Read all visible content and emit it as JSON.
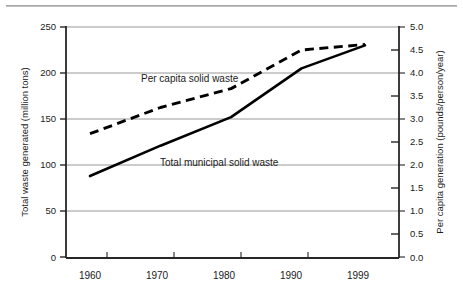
{
  "chart_data": {
    "type": "line",
    "title": "",
    "xlabel": "",
    "x": [
      1960,
      1970,
      1980,
      1990,
      1999
    ],
    "xtick_labels": [
      "1960",
      "1970",
      "1980",
      "1990",
      "1999"
    ],
    "x_minor_ticks": [
      1965,
      1975,
      1985,
      1995
    ],
    "grid": "horizontal",
    "legend": "inline-annotation",
    "axes": {
      "left": {
        "label": "Total waste generated (million tons)",
        "ylim": [
          0,
          250
        ],
        "ticks": [
          0,
          50,
          100,
          150,
          200,
          250
        ],
        "tick_labels": [
          "0",
          "50",
          "100",
          "150",
          "200",
          "250"
        ]
      },
      "right": {
        "label": "Per capita generation (pounds/person/year)",
        "ylim": [
          0.0,
          5.0
        ],
        "ticks": [
          0.0,
          0.5,
          1.0,
          1.5,
          2.0,
          2.5,
          3.0,
          3.5,
          4.0,
          4.5,
          5.0
        ],
        "tick_labels": [
          "0.0",
          "0.5",
          "1.0",
          "1.5",
          "2.0",
          "2.5",
          "3.0",
          "3.5",
          "4.0",
          "4.5",
          "5.0"
        ]
      }
    },
    "series": [
      {
        "name": "Total municipal solid waste",
        "style": "solid",
        "axis": "left",
        "units": "million tons",
        "x": [
          1960,
          1970,
          1980,
          1990,
          1999
        ],
        "values": [
          88,
          121,
          152,
          205,
          230
        ],
        "annotation": {
          "text": "Total municipal solid waste",
          "x": 1977,
          "y": 108
        }
      },
      {
        "name": "Per capita solid waste",
        "style": "dashed",
        "axis": "right",
        "units": "pounds/person/year",
        "x": [
          1960,
          1970,
          1980,
          1990,
          1999
        ],
        "values": [
          2.68,
          3.25,
          3.66,
          4.5,
          4.62
        ],
        "annotation": {
          "text": "Per capita solid waste",
          "x": 1971.5,
          "y": 3.84
        }
      }
    ]
  },
  "axis_titles": {
    "left": "Total waste generated (million tons)",
    "right": "Per capita generation (pounds/person/year)"
  },
  "left_ticks": [
    "250",
    "200",
    "150",
    "100",
    "50",
    "0"
  ],
  "right_ticks": [
    "5.0",
    "4.5",
    "4.0",
    "3.5",
    "3.0",
    "2.5",
    "2.0",
    "1.5",
    "1.0",
    "0.5",
    "0.0"
  ],
  "x_ticks": [
    "1960",
    "1970",
    "1980",
    "1990",
    "1999"
  ],
  "series_labels": {
    "per_capita": "Per capita solid waste",
    "total": "Total municipal solid waste"
  },
  "colors": {
    "line": "#000000",
    "grid": "#8c8c8c",
    "axis": "#262626",
    "background": "#ffffff"
  }
}
